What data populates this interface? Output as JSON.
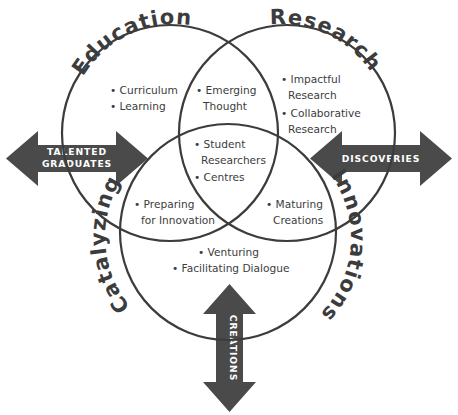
{
  "diagram": {
    "colors": {
      "stroke": "#3c3c3c",
      "text": "#3c3c3c",
      "arrow_fill": "#4a4a4a",
      "arrow_text": "#ffffff",
      "background": "#ffffff"
    },
    "circles": [
      {
        "id": "education",
        "label": "Education",
        "cx": 170,
        "cy": 133,
        "r": 108
      },
      {
        "id": "research",
        "label": "Research",
        "cx": 287,
        "cy": 133,
        "r": 108
      },
      {
        "id": "innovations",
        "label_left": "Catalyzing",
        "label_right": "Innovations",
        "cx": 228,
        "cy": 232,
        "r": 108
      }
    ],
    "regions": {
      "education_only": {
        "name": "Education",
        "items": [
          "Curriculum",
          "Learning"
        ]
      },
      "research_only": {
        "name": "Research",
        "items": [
          "Impactful Research",
          "Collaborative Research"
        ]
      },
      "innovations_only": {
        "name": "Catalyzing Innovations",
        "items": [
          "Venturing",
          "Facilitating Dialogue"
        ]
      },
      "education_research": {
        "name": "Education ∩ Research",
        "items": [
          "Emerging Thought"
        ]
      },
      "education_innovations": {
        "name": "Education ∩ Innovations",
        "items": [
          "Preparing for Innovation"
        ]
      },
      "research_innovations": {
        "name": "Research ∩ Innovations",
        "items": [
          "Maturing Creations"
        ]
      },
      "center": {
        "name": "All three",
        "items": [
          "Student Researchers",
          "Centres"
        ]
      }
    },
    "bullets": {
      "curriculum": "• Curriculum",
      "learning": "• Learning",
      "emerging_1": "• Emerging",
      "emerging_2": "Thought",
      "impactful_1": "• Impactful",
      "impactful_2": "Research",
      "collaborative_1": "• Collaborative",
      "collaborative_2": "Research",
      "student_1": "• Student",
      "student_2": "Researchers",
      "centres": "• Centres",
      "preparing_1": "• Preparing",
      "preparing_2": "for Innovation",
      "maturing_1": "• Maturing",
      "maturing_2": "Creations",
      "venturing": "• Venturing",
      "facilitating": "• Facilitating Dialogue"
    },
    "arrows": [
      {
        "id": "talented-graduates",
        "direction": "horizontal-left",
        "label_line1": "TALENTED",
        "label_line2": "GRADUATES"
      },
      {
        "id": "discoveries",
        "direction": "horizontal-right",
        "label_line1": "DISCOVERIES",
        "label_line2": ""
      },
      {
        "id": "creations",
        "direction": "vertical-bottom",
        "label_line1": "CREATIONS",
        "label_line2": ""
      }
    ],
    "labels": {
      "education": "Education",
      "research": "Research",
      "catalyzing": "Catalyzing",
      "innovations": "Innovations"
    }
  }
}
